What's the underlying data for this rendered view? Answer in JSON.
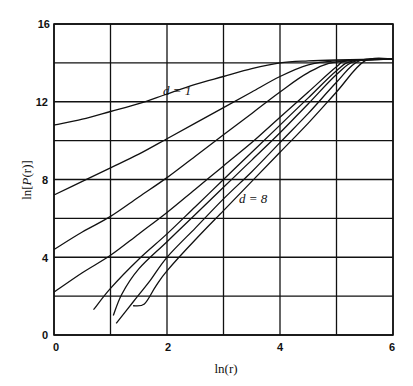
{
  "chart_data": {
    "type": "line",
    "title": "",
    "xlabel": "ln(r)",
    "ylabel": "ln[P(r)]",
    "xlim": [
      0,
      6
    ],
    "ylim": [
      0,
      16
    ],
    "xticks": [
      "0",
      "2",
      "4",
      "6"
    ],
    "yticks": [
      "0",
      "4",
      "8",
      "12",
      "16"
    ],
    "grid": true,
    "grid_x": [
      0,
      1,
      2,
      3,
      4,
      5,
      6
    ],
    "grid_y": [
      0,
      2,
      4,
      6,
      8,
      10,
      12,
      14,
      16
    ],
    "annotations": [
      {
        "text": "d = 1",
        "x": 2.0,
        "y": 12.3
      },
      {
        "text": "d = 8",
        "x": 3.2,
        "y": 7.0
      }
    ],
    "series": [
      {
        "name": "d=1",
        "points": [
          [
            0,
            10.8
          ],
          [
            0.5,
            11.1
          ],
          [
            1,
            11.5
          ],
          [
            1.5,
            11.9
          ],
          [
            2,
            12.4
          ],
          [
            2.5,
            12.9
          ],
          [
            3,
            13.3
          ],
          [
            3.5,
            13.7
          ],
          [
            4,
            14.0
          ],
          [
            4.5,
            14.1
          ],
          [
            5,
            14.15
          ],
          [
            6,
            14.2
          ]
        ]
      },
      {
        "name": "d=2",
        "points": [
          [
            0,
            7.2
          ],
          [
            0.5,
            7.9
          ],
          [
            1,
            8.6
          ],
          [
            1.5,
            9.3
          ],
          [
            2,
            10.1
          ],
          [
            2.5,
            10.9
          ],
          [
            3,
            11.7
          ],
          [
            3.5,
            12.5
          ],
          [
            4,
            13.3
          ],
          [
            4.5,
            13.9
          ],
          [
            5,
            14.1
          ],
          [
            6,
            14.2
          ]
        ]
      },
      {
        "name": "d=3",
        "points": [
          [
            0,
            4.4
          ],
          [
            0.5,
            5.3
          ],
          [
            1,
            6.1
          ],
          [
            1.5,
            7.1
          ],
          [
            2,
            8.1
          ],
          [
            2.5,
            9.2
          ],
          [
            3,
            10.3
          ],
          [
            3.5,
            11.4
          ],
          [
            4,
            12.5
          ],
          [
            4.5,
            13.5
          ],
          [
            5,
            14.05
          ],
          [
            6,
            14.2
          ]
        ]
      },
      {
        "name": "d=4",
        "points": [
          [
            0,
            2.2
          ],
          [
            0.5,
            3.2
          ],
          [
            1,
            4.1
          ],
          [
            1.5,
            5.2
          ],
          [
            2,
            6.3
          ],
          [
            2.5,
            7.5
          ],
          [
            3,
            8.7
          ],
          [
            3.5,
            9.9
          ],
          [
            4,
            11.2
          ],
          [
            4.5,
            12.5
          ],
          [
            5,
            13.8
          ],
          [
            5.2,
            14.1
          ],
          [
            6,
            14.2
          ]
        ]
      },
      {
        "name": "d=5",
        "points": [
          [
            0.7,
            1.3
          ],
          [
            1,
            2.4
          ],
          [
            1.5,
            3.9
          ],
          [
            2,
            5.2
          ],
          [
            2.5,
            6.6
          ],
          [
            3,
            8.0
          ],
          [
            3.5,
            9.4
          ],
          [
            4,
            10.8
          ],
          [
            4.5,
            12.2
          ],
          [
            5,
            13.6
          ],
          [
            5.3,
            14.1
          ],
          [
            6,
            14.2
          ]
        ]
      },
      {
        "name": "d=6",
        "points": [
          [
            1.05,
            1.0
          ],
          [
            1.2,
            2.1
          ],
          [
            1.5,
            3.4
          ],
          [
            2,
            4.8
          ],
          [
            2.5,
            6.2
          ],
          [
            3,
            7.6
          ],
          [
            3.5,
            9.0
          ],
          [
            4,
            10.4
          ],
          [
            4.5,
            11.9
          ],
          [
            5,
            13.4
          ],
          [
            5.35,
            14.1
          ],
          [
            6,
            14.2
          ]
        ]
      },
      {
        "name": "d=7",
        "points": [
          [
            1.1,
            0.6
          ],
          [
            1.4,
            1.7
          ],
          [
            1.7,
            2.8
          ],
          [
            2,
            4.0
          ],
          [
            2.5,
            5.5
          ],
          [
            3,
            7.0
          ],
          [
            3.5,
            8.4
          ],
          [
            4,
            9.9
          ],
          [
            4.5,
            11.4
          ],
          [
            5,
            13.0
          ],
          [
            5.4,
            14.1
          ],
          [
            6,
            14.2
          ]
        ]
      },
      {
        "name": "d=8",
        "points": [
          [
            1.4,
            1.5
          ],
          [
            1.6,
            1.6
          ],
          [
            1.8,
            2.5
          ],
          [
            2,
            3.3
          ],
          [
            2.5,
            4.9
          ],
          [
            3,
            6.4
          ],
          [
            3.5,
            7.9
          ],
          [
            4,
            9.4
          ],
          [
            4.5,
            10.9
          ],
          [
            5,
            12.5
          ],
          [
            5.5,
            14.1
          ],
          [
            6,
            14.2
          ]
        ]
      }
    ]
  },
  "labels": {
    "xlabel": "ln(r)",
    "ylabel_prefix": "ln[",
    "ylabel_func": "P",
    "ylabel_suffix": "(r)]",
    "annot_d1": "d = 1",
    "annot_d8": "d = 8",
    "xtick_0": "0",
    "xtick_2": "2",
    "xtick_4": "4",
    "xtick_6": "6",
    "ytick_0": "0",
    "ytick_4": "4",
    "ytick_8": "8",
    "ytick_12": "12",
    "ytick_16": "16"
  }
}
